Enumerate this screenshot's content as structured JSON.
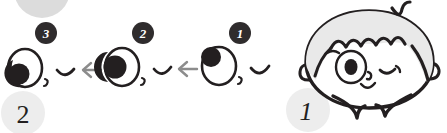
{
  "figure": {
    "ink_color": "#231f20",
    "hair_fill": "#e8e8e8",
    "arrow_color": "#8a8a8a",
    "badge_fill": "#2f2c2d",
    "step_marker_fill": "#e3e3e3",
    "background": "#ffffff"
  },
  "step_markers": [
    {
      "name": "step-marker-2",
      "label": "2",
      "style": "upright"
    },
    {
      "name": "step-marker-1",
      "label": "1",
      "style": "italic"
    }
  ],
  "partial_marker": {
    "name": "step-marker-partial-top",
    "label": "",
    "note": "cut off gray circle at top edge"
  },
  "sequence": {
    "name": "eye-drawing-sequence",
    "direction": "right-to-left",
    "arrows": [
      {
        "name": "arrow-left-1",
        "glyph": "←"
      },
      {
        "name": "arrow-left-2",
        "glyph": "←"
      }
    ],
    "steps": [
      {
        "badge": "3",
        "name": "eye-step-3",
        "pupil_position": "bottom-left",
        "has_nose": true,
        "has_mouth": true
      },
      {
        "badge": "2",
        "name": "eye-step-2",
        "pupil_position": "middle-left",
        "has_nose": true,
        "has_mouth": true
      },
      {
        "badge": "1",
        "name": "eye-step-1",
        "pupil_position": "top-left",
        "has_nose": true,
        "has_mouth": true
      }
    ]
  },
  "face": {
    "name": "cartoon-face",
    "features": [
      {
        "name": "hair-cowlick",
        "label": "cowlick"
      },
      {
        "name": "hair-fringe",
        "label": "wavy fringe"
      },
      {
        "name": "left-ear",
        "label": "ear"
      },
      {
        "name": "right-ear",
        "label": "ear"
      },
      {
        "name": "open-eye",
        "label": "open eye"
      },
      {
        "name": "winking-eye",
        "label": "winking eye"
      },
      {
        "name": "eyebrow",
        "label": "eyebrow"
      },
      {
        "name": "nose",
        "label": "nose"
      },
      {
        "name": "shoulder-left",
        "label": "shoulder"
      },
      {
        "name": "shoulder-right",
        "label": "shoulder"
      }
    ]
  }
}
